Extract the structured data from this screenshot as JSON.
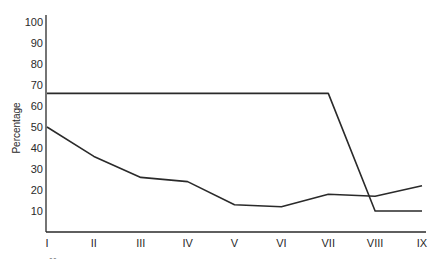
{
  "chart_data": {
    "type": "line",
    "title": "",
    "xlabel": "",
    "ylabel": "Percentage",
    "ylim": [
      0,
      100
    ],
    "yticks": [
      10,
      20,
      30,
      40,
      50,
      60,
      70,
      80,
      90,
      100
    ],
    "categories": [
      "I",
      "II",
      "III",
      "IV",
      "V",
      "VI",
      "VII",
      "VIII",
      "IX"
    ],
    "grid": false,
    "legend": null,
    "series": [
      {
        "name": "upper line",
        "values": [
          66,
          66,
          66,
          66,
          66,
          66,
          66,
          10,
          10
        ]
      },
      {
        "name": "lower line",
        "values": [
          50,
          36,
          26,
          24,
          13,
          12,
          18,
          17,
          22
        ]
      }
    ],
    "line_color": "#2a2a2a"
  }
}
